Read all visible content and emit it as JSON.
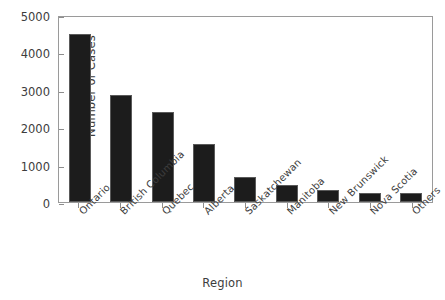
{
  "chart_data": {
    "type": "bar",
    "title": "",
    "xlabel": "Region",
    "ylabel": "Number of Cases",
    "categories": [
      "Ontario",
      "British Columbia",
      "Quebec",
      "Alberta",
      "Saskatchewan",
      "Manitoba",
      "New Brunswick",
      "Nova Scotia",
      "Others"
    ],
    "values": [
      4480,
      2870,
      2400,
      1540,
      670,
      450,
      310,
      250,
      240
    ],
    "ylim": [
      0,
      5000
    ],
    "yticks": [
      0,
      1000,
      2000,
      3000,
      4000,
      5000
    ],
    "ytick_labels": [
      "0",
      "1000",
      "2000",
      "3000",
      "4000",
      "5000"
    ],
    "grid": false,
    "legend": "none",
    "bar_color": "#1c1c1c",
    "axis_color": "#8d8d8d",
    "text_color": "#3d3d3d",
    "background": "#ffffff"
  }
}
